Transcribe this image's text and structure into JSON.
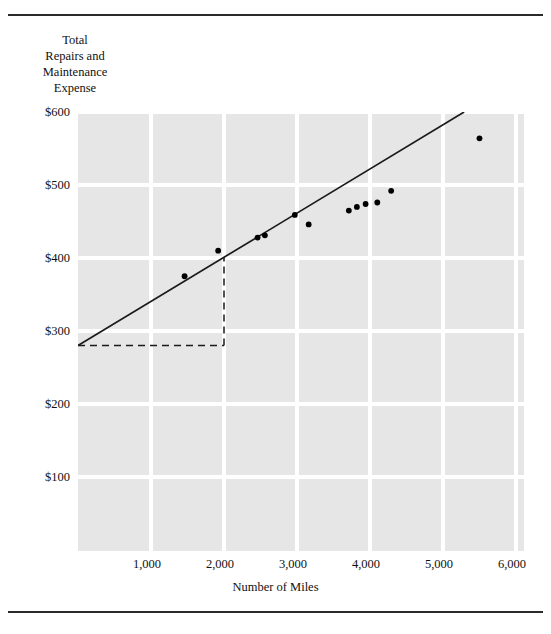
{
  "figure": {
    "title": "Total\nRepairs and\nMaintenance\nExpense",
    "top_rule": "horizontal-rule",
    "bottom_rule": "horizontal-rule"
  },
  "chart_data": {
    "type": "scatter",
    "title": "Total Repairs and Maintenance Expense",
    "xlabel": "Number of Miles",
    "ylabel": "Total Repairs and Maintenance Expense",
    "xlim": [
      0,
      6000
    ],
    "ylim": [
      0,
      600
    ],
    "grid": true,
    "legend": "none",
    "x_ticks": [
      "1,000",
      "2,000",
      "3,000",
      "4,000",
      "5,000",
      "6,000"
    ],
    "x_tick_values": [
      1000,
      2000,
      3000,
      4000,
      5000,
      6000
    ],
    "y_ticks": [
      "$100",
      "$200",
      "$300",
      "$400",
      "$500",
      "$600"
    ],
    "y_tick_values": [
      100,
      200,
      300,
      400,
      500,
      600
    ],
    "points": [
      {
        "x": 1460,
        "y": 375
      },
      {
        "x": 1920,
        "y": 410
      },
      {
        "x": 2460,
        "y": 428
      },
      {
        "x": 2560,
        "y": 431
      },
      {
        "x": 2970,
        "y": 459
      },
      {
        "x": 3160,
        "y": 446
      },
      {
        "x": 3710,
        "y": 465
      },
      {
        "x": 3820,
        "y": 470
      },
      {
        "x": 3940,
        "y": 474
      },
      {
        "x": 4100,
        "y": 476
      },
      {
        "x": 4290,
        "y": 492
      },
      {
        "x": 5500,
        "y": 564
      }
    ],
    "regression_line": {
      "label": "fitted-line",
      "intercept": 280,
      "slope": 0.0605,
      "x_start": 0,
      "y_start": 280,
      "x_end": 6000,
      "y_end": 643
    },
    "reference_lines": {
      "style": "dashed",
      "horizontal": {
        "y": 280,
        "x_start": 0,
        "x_end": 2000
      },
      "vertical": {
        "x": 2000,
        "y_start": 280,
        "y_end": 401
      }
    }
  },
  "colors": {
    "plot_background": "#e6e6e6",
    "gridline": "#ffffff",
    "line": "#1a1a1a",
    "point": "#000000",
    "rule": "#2a2a2a",
    "text": "#111111"
  }
}
